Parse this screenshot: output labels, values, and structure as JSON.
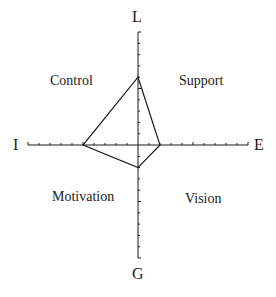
{
  "diagram": {
    "type": "four-axis profile diagram",
    "axes": {
      "top": "L",
      "bottom": "G",
      "left": "I",
      "right": "E"
    },
    "quadrants": {
      "top_left": "Control",
      "top_right": "Support",
      "bottom_left": "Motivation",
      "bottom_right": "Vision"
    },
    "ticks_per_half_axis": 10,
    "profile_values": {
      "L": 6,
      "E": 2,
      "G": 2,
      "I": 5
    },
    "colors": {
      "line": "#1a1a1a",
      "background": "#ffffff"
    }
  }
}
